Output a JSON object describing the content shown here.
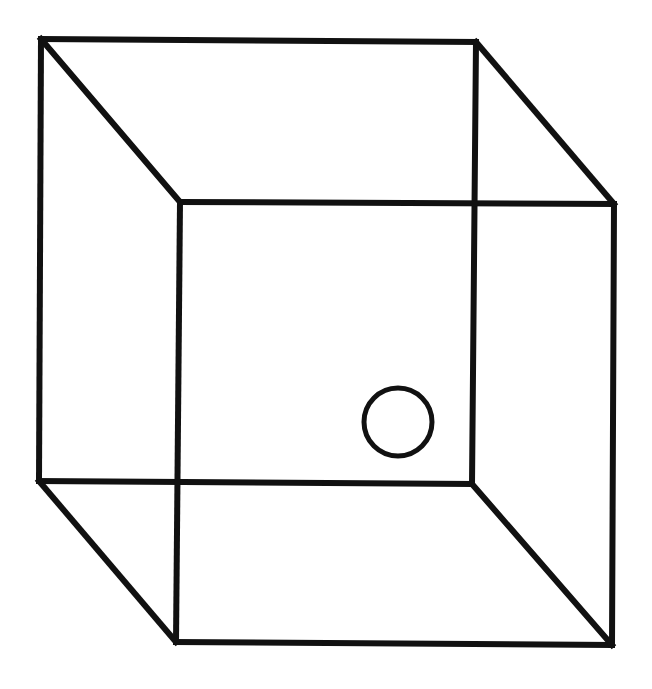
{
  "diagram": {
    "title": "",
    "type": "wireframe-cube",
    "stroke_color": "#111111",
    "background": "#ffffff",
    "stroke_width": 6,
    "vertices": {
      "back_top_left": [
        41,
        39
      ],
      "back_top_right": [
        476,
        42
      ],
      "back_bottom_left": [
        39,
        481
      ],
      "back_bottom_right": [
        472,
        484
      ],
      "front_top_left": [
        180,
        202
      ],
      "front_top_right": [
        614,
        204
      ],
      "front_bottom_left": [
        176,
        642
      ],
      "front_bottom_right": [
        612,
        645
      ]
    },
    "circle": {
      "cx": 398,
      "cy": 422,
      "r": 34,
      "stroke_width": 5
    }
  }
}
